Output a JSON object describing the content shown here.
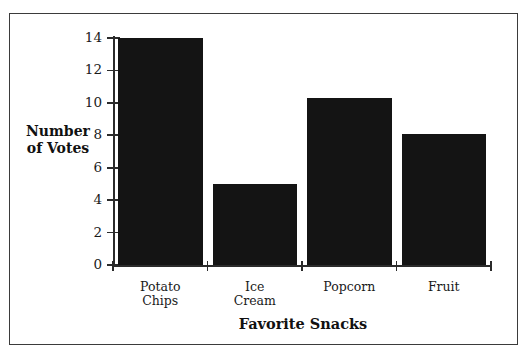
{
  "chart_data": {
    "type": "bar",
    "title": "",
    "categories": [
      "Potato Chips",
      "Ice Cream",
      "Popcorn",
      "Fruit"
    ],
    "category_lines": [
      [
        "Potato",
        "Chips"
      ],
      [
        "Ice",
        "Cream"
      ],
      [
        "Popcorn"
      ],
      [
        "Fruit"
      ]
    ],
    "values": [
      14,
      5,
      10.3,
      8.1
    ],
    "xlabel": "Favorite Snacks",
    "ylabel": "Number of Votes",
    "ylabel_lines": [
      "Number",
      "of Votes"
    ],
    "ylim": [
      0,
      14
    ],
    "yticks": [
      0,
      2,
      4,
      6,
      8,
      10,
      12,
      14
    ],
    "ytick_labels": [
      "0",
      "2",
      "4",
      "6",
      "8",
      "10",
      "12",
      "14"
    ],
    "grid": false,
    "legend": false,
    "bar_color": "#141414",
    "axis_color": "#2b2b2b",
    "background_color": "#ffffff",
    "frame_color": "#3b3b3b"
  }
}
